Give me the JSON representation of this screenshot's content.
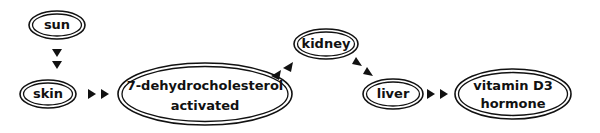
{
  "diagram": {
    "type": "flow",
    "nodes": [
      {
        "id": "sun",
        "lines": [
          "sun"
        ]
      },
      {
        "id": "skin",
        "lines": [
          "skin"
        ]
      },
      {
        "id": "dehydro",
        "lines": [
          "7-dehydrocholesterol",
          "activated"
        ]
      },
      {
        "id": "kidney",
        "lines": [
          "kidney"
        ]
      },
      {
        "id": "liver",
        "lines": [
          "liver"
        ]
      },
      {
        "id": "vitd3",
        "lines": [
          "vitamin D3",
          "hormone"
        ]
      }
    ],
    "edges": [
      {
        "from": "sun",
        "to": "skin"
      },
      {
        "from": "skin",
        "to": "dehydro"
      },
      {
        "from": "dehydro",
        "to": "kidney"
      },
      {
        "from": "kidney",
        "to": "liver"
      },
      {
        "from": "liver",
        "to": "vitd3"
      }
    ],
    "colors": {
      "stroke": "#111111",
      "background": "#ffffff"
    }
  }
}
